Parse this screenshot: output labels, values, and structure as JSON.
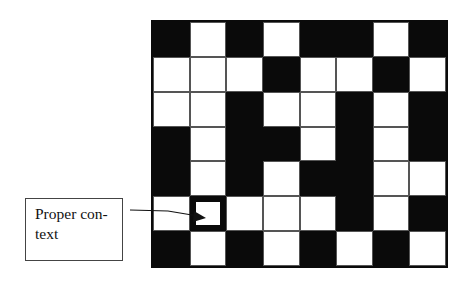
{
  "diagram": {
    "grid": {
      "rows": 7,
      "cols": 8,
      "cells": [
        [
          "B",
          "W",
          "B",
          "W",
          "B",
          "B",
          "W",
          "B"
        ],
        [
          "W",
          "W",
          "W",
          "B",
          "W",
          "W",
          "B",
          "W"
        ],
        [
          "W",
          "W",
          "B",
          "W",
          "W",
          "B",
          "W",
          "B"
        ],
        [
          "B",
          "W",
          "B",
          "B",
          "W",
          "B",
          "W",
          "B"
        ],
        [
          "B",
          "W",
          "B",
          "W",
          "B",
          "B",
          "W",
          "W"
        ],
        [
          "W",
          "H",
          "W",
          "W",
          "W",
          "B",
          "W",
          "B"
        ],
        [
          "B",
          "W",
          "B",
          "W",
          "B",
          "W",
          "B",
          "W"
        ]
      ],
      "highlighted_cell": {
        "row": 5,
        "col": 1
      },
      "colors": {
        "black": "#0a0a0a",
        "white": "#ffffff"
      }
    },
    "callout": {
      "line1": "Proper con-",
      "line2": "text"
    }
  }
}
